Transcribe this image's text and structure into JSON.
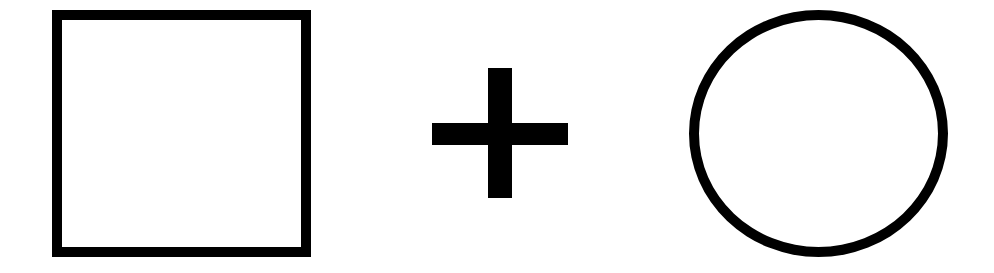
{
  "diagram": {
    "elements": [
      {
        "type": "square",
        "label": "square-outline",
        "stroke": "#000000",
        "fill": "#ffffff"
      },
      {
        "type": "operator",
        "symbol": "+",
        "color": "#000000"
      },
      {
        "type": "circle",
        "label": "circle-outline",
        "stroke": "#000000",
        "fill": "#ffffff"
      }
    ],
    "background": "#ffffff"
  }
}
